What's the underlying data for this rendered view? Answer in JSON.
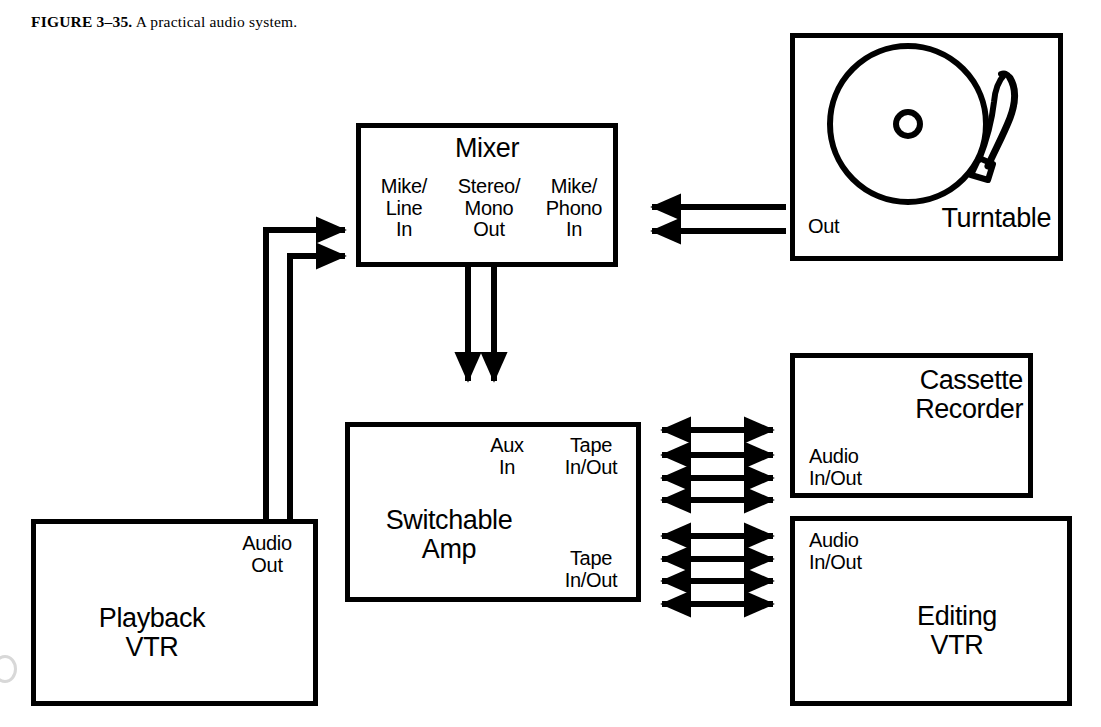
{
  "caption": {
    "figure_label": "FIGURE 3–35.",
    "text": "A practical audio system."
  },
  "boxes": {
    "mixer": {
      "title": "Mixer",
      "ports": {
        "left": "Mike/\nLine\nIn",
        "center": "Stereo/\nMono\nOut",
        "right": "Mike/\nPhono\nIn"
      }
    },
    "turntable": {
      "title": "Turntable",
      "port_out": "Out"
    },
    "amp": {
      "title": "Switchable\nAmp",
      "ports": {
        "aux_in": "Aux\nIn",
        "tape_top": "Tape\nIn/Out",
        "tape_bottom": "Tape\nIn/Out"
      }
    },
    "playback_vtr": {
      "title": "Playback\nVTR",
      "port_audio_out": "Audio\nOut"
    },
    "cassette_recorder": {
      "title": "Cassette\nRecorder",
      "port_audio_io": "Audio\nIn/Out"
    },
    "editing_vtr": {
      "title": "Editing\nVTR",
      "port_audio_io": "Audio\nIn/Out"
    }
  },
  "connections": {
    "turntable_to_mixer": {
      "label": "two single-headed arrows pointing left",
      "count": 2,
      "direction": "left"
    },
    "mixer_to_amp": {
      "label": "two single-headed arrows pointing down",
      "count": 2,
      "direction": "down"
    },
    "playback_to_mixer": {
      "label": "two routed wires with arrowheads pointing right",
      "count": 2,
      "direction": "right"
    },
    "amp_to_cassette": {
      "label": "four double-headed arrows",
      "count": 4,
      "direction": "both"
    },
    "amp_to_editing_vtr": {
      "label": "four double-headed arrows",
      "count": 4,
      "direction": "both"
    }
  },
  "colors": {
    "ink": "#000000",
    "paper": "#ffffff"
  }
}
